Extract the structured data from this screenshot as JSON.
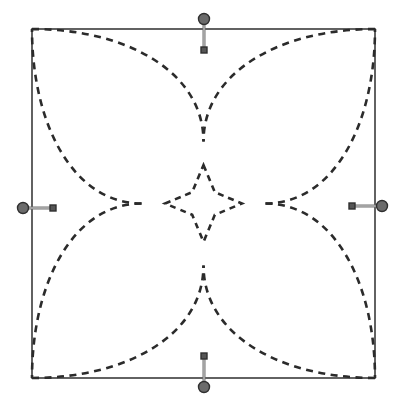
{
  "canvas": {
    "width": 396,
    "height": 401,
    "background_color": "#ffffff",
    "title": "Sketch Canvas"
  },
  "geometry": {
    "square": {
      "name": "bounding-square",
      "x": 32,
      "y": 29,
      "width": 343,
      "height": 349,
      "stroke_color": "#3b3b3b",
      "stroke_width": 1.6,
      "fill": "none",
      "line_style": "solid"
    },
    "center": {
      "x": 203.5,
      "y": 203.5
    },
    "petals": {
      "name": "four-petal-rose",
      "count": 4,
      "stroke_color": "#2b2b2b",
      "stroke_width": 2.6,
      "line_style": "dashed",
      "dash_length": 7,
      "dash_gap": 5.5,
      "fill": "none",
      "description": "Four large leaf-shaped petals each spanning from one square corner to the center, crossing near the mid-edges"
    },
    "star": {
      "name": "central-four-point-star",
      "points": 4,
      "stroke_color": "#2b2b2b",
      "stroke_width": 2.6,
      "line_style": "dashed",
      "dash_length": 6,
      "dash_gap": 5,
      "fill": "none",
      "outer_radius": 62,
      "inner_radius": 16,
      "description": "Small astroid / four-pointed star at the centre of the rose"
    }
  },
  "handles": [
    {
      "id": "handle-top",
      "name": "constraint-handle-top",
      "edge": "top",
      "anchor": {
        "x": 204,
        "y": 19
      },
      "knob": {
        "x": 204,
        "y": 50
      },
      "orientation": "vertical",
      "circle_radius": 5.5,
      "square_size": 6,
      "stem_color": "#6e6e6e",
      "circle_color": "#6b6b6b",
      "square_color": "#555555",
      "outline_color": "#2f2f2f"
    },
    {
      "id": "handle-right",
      "name": "constraint-handle-right",
      "edge": "right",
      "anchor": {
        "x": 382,
        "y": 206
      },
      "knob": {
        "x": 352,
        "y": 206
      },
      "orientation": "horizontal",
      "circle_radius": 5.5,
      "square_size": 6,
      "stem_color": "#6e6e6e",
      "circle_color": "#6b6b6b",
      "square_color": "#555555",
      "outline_color": "#2f2f2f"
    },
    {
      "id": "handle-bottom",
      "name": "constraint-handle-bottom",
      "edge": "bottom",
      "anchor": {
        "x": 204,
        "y": 387
      },
      "knob": {
        "x": 204,
        "y": 356
      },
      "orientation": "vertical",
      "circle_radius": 5.5,
      "square_size": 6,
      "stem_color": "#6e6e6e",
      "circle_color": "#6b6b6b",
      "square_color": "#555555",
      "outline_color": "#2f2f2f"
    },
    {
      "id": "handle-left",
      "name": "constraint-handle-left",
      "edge": "left",
      "anchor": {
        "x": 23,
        "y": 208
      },
      "knob": {
        "x": 53,
        "y": 208
      },
      "orientation": "horizontal",
      "circle_radius": 5.5,
      "square_size": 6,
      "stem_color": "#6e6e6e",
      "circle_color": "#6b6b6b",
      "square_color": "#555555",
      "outline_color": "#2f2f2f"
    }
  ],
  "colors": {
    "background": "#ffffff",
    "outline": "#3b3b3b",
    "construction": "#2b2b2b",
    "handle_fill": "#6b6b6b",
    "handle_stroke": "#2f2f2f"
  }
}
